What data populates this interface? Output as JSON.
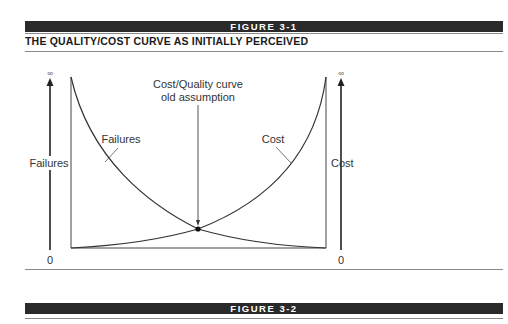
{
  "figure1": {
    "banner": "FIGURE 3-1",
    "title": "THE QUALITY/COST CURVE AS INITIALLY PERCEIVED"
  },
  "figure2": {
    "banner": "FIGURE 3-2"
  },
  "diagram": {
    "left_axis": {
      "label": "Failures",
      "top": "∞",
      "bottom": "0"
    },
    "right_axis": {
      "label": "Cost",
      "top": "∞",
      "bottom": "0"
    },
    "curve_labels": {
      "failures": "Failures",
      "cost": "Cost"
    },
    "annotation": {
      "line1": "Cost/Quality curve",
      "line2": "old assumption"
    },
    "colors": {
      "banner": "#2a2a2a",
      "line": "#333333",
      "rule": "#8a8a8a"
    }
  }
}
